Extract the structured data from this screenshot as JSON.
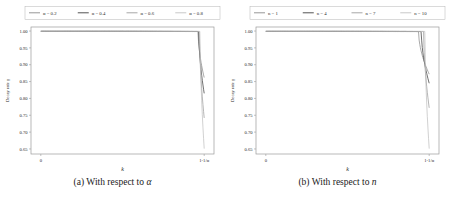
{
  "figure": {
    "panels": [
      {
        "id": "panel-alpha",
        "caption_prefix": "(a)",
        "caption_text": "With respect to",
        "caption_symbol": "α",
        "chart_data": {
          "type": "line",
          "title": "",
          "xlabel": "k",
          "ylabel": "Decay rate γ",
          "xticks": [
            "0",
            "1-1/α"
          ],
          "xtick_values": [
            0,
            1
          ],
          "yticks": [
            "1.00",
            "0.95",
            "0.90",
            "0.85",
            "0.80",
            "0.75",
            "0.70",
            "0.65"
          ],
          "ytick_values": [
            1.0,
            0.95,
            0.9,
            0.85,
            0.8,
            0.75,
            0.7,
            0.65
          ],
          "ylim": [
            0.635,
            1.012
          ],
          "xlim": [
            -0.06,
            1.06
          ],
          "grid": false,
          "legend_position": "above-center",
          "legend_title": "",
          "series": [
            {
              "name": "α = 0.2",
              "color": "#8c8c8c",
              "knee": 0.963,
              "end_y": 0.862,
              "plateau": 0.999
            },
            {
              "name": "α = 0.4",
              "color": "#3f3f3f",
              "knee": 0.967,
              "end_y": 0.815,
              "plateau": 0.9993
            },
            {
              "name": "α = 0.6",
              "color": "#9e9e9e",
              "knee": 0.971,
              "end_y": 0.742,
              "plateau": 0.9995
            },
            {
              "name": "α = 0.8",
              "color": "#c2c2c2",
              "knee": 0.975,
              "end_y": 0.651,
              "plateau": 0.9997
            }
          ]
        }
      },
      {
        "id": "panel-n",
        "caption_prefix": "(b)",
        "caption_text": "With respect to",
        "caption_symbol": "n",
        "chart_data": {
          "type": "line",
          "title": "",
          "xlabel": "k",
          "ylabel": "Decay rate γ",
          "xticks": [
            "0",
            "1-1/α"
          ],
          "xtick_values": [
            0,
            1
          ],
          "yticks": [
            "1.00",
            "0.95",
            "0.90",
            "0.85",
            "0.80",
            "0.75",
            "0.70",
            "0.65"
          ],
          "ytick_values": [
            1.0,
            0.95,
            0.9,
            0.85,
            0.8,
            0.75,
            0.7,
            0.65
          ],
          "ylim": [
            0.635,
            1.012
          ],
          "xlim": [
            -0.06,
            1.06
          ],
          "grid": false,
          "legend_position": "above-center",
          "legend_title": "",
          "series": [
            {
              "name": "n = 1",
              "color": "#8c8c8c",
              "knee": 0.935,
              "end_y": 0.872,
              "plateau": 0.9988
            },
            {
              "name": "n = 4",
              "color": "#3f3f3f",
              "knee": 0.952,
              "end_y": 0.845,
              "plateau": 0.9991
            },
            {
              "name": "n = 7",
              "color": "#9e9e9e",
              "knee": 0.966,
              "end_y": 0.772,
              "plateau": 0.9994
            },
            {
              "name": "n = 10",
              "color": "#c2c2c2",
              "knee": 0.974,
              "end_y": 0.651,
              "plateau": 0.9996
            }
          ]
        }
      }
    ]
  }
}
